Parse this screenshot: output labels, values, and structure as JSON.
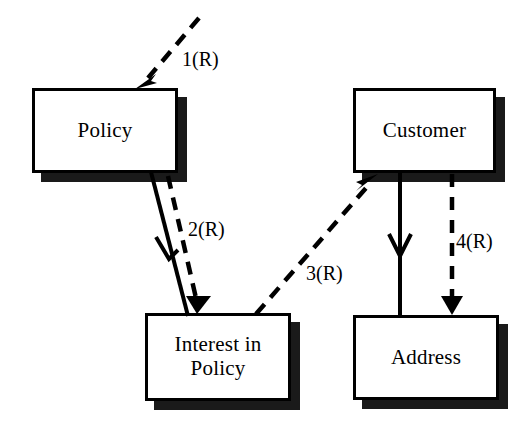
{
  "diagram": {
    "type": "object-interaction-diagram",
    "background_color": "#ffffff",
    "line_color": "#000000",
    "shadow_color": "#1a1a1a",
    "nodes": [
      {
        "id": "policy",
        "label": "Policy",
        "x": 32,
        "y": 88,
        "w": 146,
        "h": 85
      },
      {
        "id": "customer",
        "label": "Customer",
        "x": 353,
        "y": 88,
        "w": 143,
        "h": 85
      },
      {
        "id": "interest",
        "label": "Interest in\nPolicy",
        "x": 145,
        "y": 313,
        "w": 146,
        "h": 88
      },
      {
        "id": "address",
        "label": "Address",
        "x": 353,
        "y": 315,
        "w": 146,
        "h": 85
      }
    ],
    "edges": [
      {
        "id": "edge-1",
        "label": "1(R)",
        "style": "dashed",
        "arrowhead": "thin-barbed",
        "from": "offscreen-upper-right",
        "to": "policy",
        "label_x": 182,
        "label_y": 48
      },
      {
        "id": "edge-2-solid",
        "label": "",
        "style": "solid",
        "arrowhead": "open-v",
        "from": "policy",
        "to": "interest"
      },
      {
        "id": "edge-2",
        "label": "2(R)",
        "style": "dashed",
        "arrowhead": "filled-triangle",
        "from": "policy",
        "to": "interest",
        "label_x": 188,
        "label_y": 218
      },
      {
        "id": "edge-3",
        "label": "3(R)",
        "style": "dashed",
        "arrowhead": "thin-barbed",
        "from": "interest",
        "to": "customer",
        "label_x": 306,
        "label_y": 262
      },
      {
        "id": "edge-4-solid",
        "label": "",
        "style": "solid",
        "arrowhead": "open-v",
        "from": "customer",
        "to": "address"
      },
      {
        "id": "edge-4",
        "label": "4(R)",
        "style": "dashed",
        "arrowhead": "filled-triangle",
        "from": "customer",
        "to": "address",
        "label_x": 456,
        "label_y": 230
      }
    ]
  }
}
